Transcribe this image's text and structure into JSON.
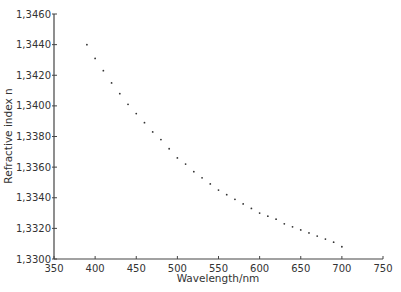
{
  "chart_data": {
    "type": "scatter",
    "title": "",
    "xlabel": "Wavelength/nm",
    "ylabel": "Refractive index n",
    "xlim": [
      350,
      750
    ],
    "ylim": [
      1.33,
      1.346
    ],
    "x_ticks": [
      "350",
      "400",
      "450",
      "500",
      "550",
      "600",
      "650",
      "700",
      "750"
    ],
    "y_ticks": [
      "1.3300",
      "1.3320",
      "1.3340",
      "1.3360",
      "1.3380",
      "1.3400",
      "1.3420",
      "1.3440",
      "1.3460"
    ],
    "grid": false,
    "legend": null,
    "series": [
      {
        "name": "n(λ)",
        "x": [
          390,
          400,
          410,
          420,
          430,
          440,
          450,
          460,
          470,
          480,
          490,
          500,
          510,
          520,
          530,
          540,
          550,
          560,
          570,
          580,
          590,
          600,
          610,
          620,
          630,
          640,
          650,
          660,
          670,
          680,
          690,
          700
        ],
        "y": [
          1.344,
          1.3431,
          1.3423,
          1.3415,
          1.3408,
          1.3401,
          1.3395,
          1.3389,
          1.3383,
          1.3378,
          1.3372,
          1.3366,
          1.3362,
          1.3357,
          1.3353,
          1.3349,
          1.3345,
          1.3342,
          1.3339,
          1.3336,
          1.3333,
          1.333,
          1.3328,
          1.3326,
          1.3323,
          1.3321,
          1.3319,
          1.3317,
          1.3315,
          1.3313,
          1.3311,
          1.3308
        ]
      }
    ]
  }
}
